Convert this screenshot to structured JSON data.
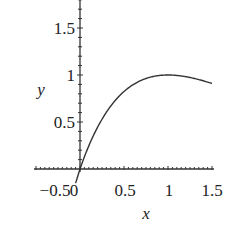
{
  "chart_data": {
    "type": "line",
    "title": "",
    "xlabel": "x",
    "ylabel": "y",
    "xlim": [
      -0.5,
      1.5
    ],
    "ylim": [
      0,
      1.8
    ],
    "grid": false,
    "legend": null,
    "x_ticks": [
      "−0.5",
      "0",
      "0.5",
      "1",
      "1.5"
    ],
    "y_ticks": [
      "0.5",
      "1",
      "1.5"
    ],
    "series": [
      {
        "name": "y = x·e^(1−x)",
        "color": "#333333",
        "x": [
          0,
          0.1,
          0.2,
          0.3,
          0.4,
          0.5,
          0.6,
          0.7,
          0.8,
          0.9,
          1.0,
          1.1,
          1.2,
          1.3,
          1.4,
          1.5
        ],
        "y": [
          0,
          0.246,
          0.445,
          0.604,
          0.729,
          0.824,
          0.895,
          0.945,
          0.977,
          0.995,
          1.0,
          0.995,
          0.982,
          0.963,
          0.939,
          0.91
        ]
      }
    ],
    "extra_segment": {
      "x": [
        -0.05,
        0
      ],
      "y": [
        -0.15,
        0
      ]
    }
  },
  "axes": {
    "x_label": "x",
    "y_label": "y",
    "x_tick_labels": [
      "−0.5",
      "0",
      "0.5",
      "1",
      "1.5"
    ],
    "y_tick_labels": [
      "0.5",
      "1",
      "1.5"
    ]
  }
}
